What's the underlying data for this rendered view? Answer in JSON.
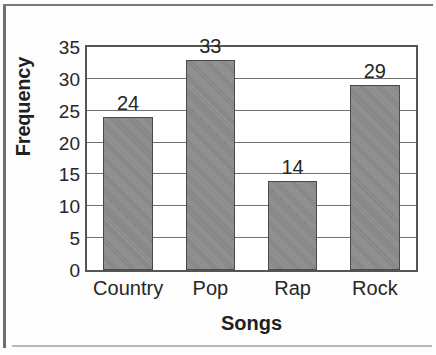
{
  "chart_data": {
    "type": "bar",
    "title": "",
    "subtitle": "",
    "xlabel": "Songs",
    "ylabel": "Frequency",
    "categories": [
      "Country",
      "Pop",
      "Rap",
      "Rock"
    ],
    "values": [
      24,
      33,
      14,
      29
    ],
    "data_labels": [
      "24",
      "33",
      "14",
      "29"
    ],
    "ylim": [
      0,
      35
    ],
    "ytick_labels": [
      "0",
      "5",
      "10",
      "15",
      "20",
      "25",
      "30",
      "35"
    ],
    "ytick_values": [
      0,
      5,
      10,
      15,
      20,
      25,
      30,
      35
    ],
    "grid": "horizontal",
    "legend": null,
    "bar_color": "#8a8a8a",
    "bar_border_color": "#4a4a4a",
    "axis_color": "#555555",
    "grid_color": "#6f6f6f",
    "text_color": "#262626"
  }
}
